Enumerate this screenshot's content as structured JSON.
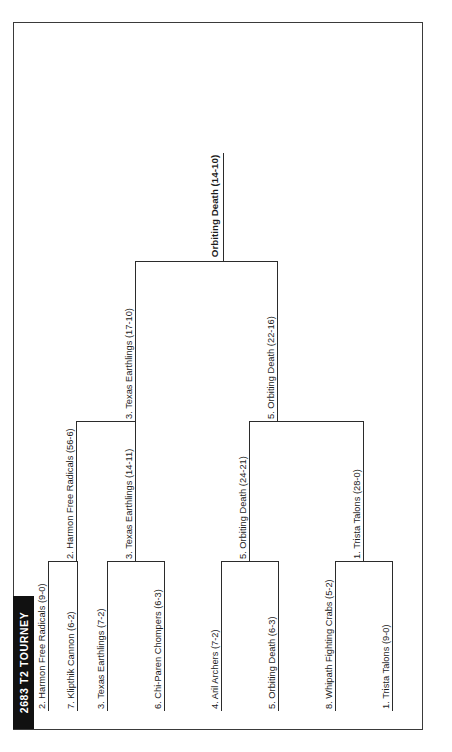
{
  "title": "2683 T2 TOURNEY",
  "colors": {
    "banner_bg": "#111111",
    "banner_text": "#ffffff",
    "line": "#2b2b2b",
    "frame": "#3a3a3a",
    "background": "#ffffff"
  },
  "bracket": {
    "rounds": [
      {
        "name": "round-1",
        "teams": [
          {
            "seed": "1",
            "name": "Trista Talons",
            "record": "9-0",
            "label": "1. Trista Talons (9-0)"
          },
          {
            "seed": "8",
            "name": "Whipath Fighting Crabs",
            "record": "5-2",
            "label": "8. Whipath Fighting Crabs (5-2)"
          },
          {
            "seed": "5",
            "name": "Orbiting Death",
            "record": "6-3",
            "label": "5. Orbiting Death (6-3)"
          },
          {
            "seed": "4",
            "name": "Aril Archers",
            "record": "7-2",
            "label": "4. Aril Archers (7-2)"
          },
          {
            "seed": "6",
            "name": "Chi-Paren Chompers",
            "record": "6-3",
            "label": "6. Chi-Paren Chompers (6-3)"
          },
          {
            "seed": "3",
            "name": "Texas Earthlings",
            "record": "7-2",
            "label": "3. Texas Earthlings (7-2)"
          },
          {
            "seed": "7",
            "name": "Klipthik Cannon",
            "record": "6-2",
            "label": "7. Klipthik Cannon (6-2)"
          },
          {
            "seed": "2",
            "name": "Harmon Free Radicals",
            "record": "9-0",
            "label": "2. Harmon Free Radicals (9-0)"
          }
        ]
      },
      {
        "name": "round-2",
        "teams": [
          {
            "seed": "1",
            "name": "Trista Talons",
            "record": "28-0",
            "label": "1. Trista Talons (28-0)"
          },
          {
            "seed": "5",
            "name": "Orbiting Death",
            "record": "24-21",
            "label": "5. Orbiting Death (24-21)"
          },
          {
            "seed": "3",
            "name": "Texas Earthlings",
            "record": "14-11",
            "label": "3. Texas Earthlings (14-11)"
          },
          {
            "seed": "2",
            "name": "Harmon Free Radicals",
            "record": "56-6",
            "label": "2. Harmon Free Radicals (56-6)"
          }
        ]
      },
      {
        "name": "semifinals",
        "teams": [
          {
            "seed": "5",
            "name": "Orbiting Death",
            "record": "22-16",
            "label": "5. Orbiting Death (22-16)"
          },
          {
            "seed": "3",
            "name": "Texas Earthlings",
            "record": "17-10",
            "label": "3. Texas Earthlings (17-10)"
          }
        ]
      },
      {
        "name": "final",
        "teams": [
          {
            "seed": "",
            "name": "Orbiting Death",
            "record": "14-10",
            "label": "Orbiting Death (14-10)"
          }
        ]
      }
    ]
  }
}
